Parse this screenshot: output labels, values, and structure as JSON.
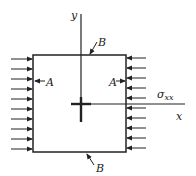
{
  "diagram": {
    "type": "stress-element",
    "colors": {
      "stroke": "#222222",
      "background": "#ffffff"
    },
    "labels": {
      "y_axis": "y",
      "x_axis": "x",
      "top_edge": "B",
      "bottom_edge": "B",
      "left_edge": "A",
      "right_edge": "A",
      "stress": "σ",
      "stress_subscript": "xx"
    },
    "left_arrows_count": 10,
    "right_arrows_count": 10
  }
}
